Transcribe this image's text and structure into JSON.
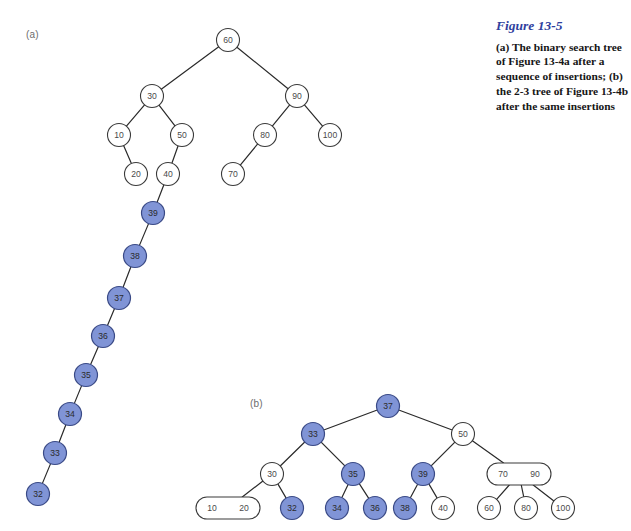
{
  "figure": {
    "panel_a_label": "(a)",
    "panel_b_label": "(b)",
    "caption_title": "Figure 13-5",
    "caption_body": "(a) The binary search tree of Figure 13-4a after a sequence of insertions; (b) the 2-3 tree of Figure 13-4b after the same insertions",
    "accent_color": "#2f3f9e",
    "highlight_color": "#8094d6",
    "stroke_color": "#2a2a2a"
  },
  "chart_data": {
    "type": "diagram",
    "title": "Figure 13-5",
    "subtitle": "(a) The binary search tree of Figure 13-4a after a sequence of insertions; (b) the 2-3 tree of Figure 13-4b after the same insertions",
    "panels": [
      {
        "id": "a",
        "label": "(a)",
        "kind": "binary-search-tree",
        "nodes": [
          {
            "id": "a60",
            "label": "60",
            "x": 228,
            "y": 40,
            "r": 11.5,
            "shape": "circle",
            "highlighted": false
          },
          {
            "id": "a30",
            "label": "30",
            "x": 152,
            "y": 96,
            "r": 11.5,
            "shape": "circle",
            "highlighted": false
          },
          {
            "id": "a90",
            "label": "90",
            "x": 297,
            "y": 96,
            "r": 11.5,
            "shape": "circle",
            "highlighted": false
          },
          {
            "id": "a10",
            "label": "10",
            "x": 119,
            "y": 135,
            "r": 11.5,
            "shape": "circle",
            "highlighted": false
          },
          {
            "id": "a50",
            "label": "50",
            "x": 182,
            "y": 135,
            "r": 11.5,
            "shape": "circle",
            "highlighted": false
          },
          {
            "id": "a80",
            "label": "80",
            "x": 265,
            "y": 135,
            "r": 11.5,
            "shape": "circle",
            "highlighted": false
          },
          {
            "id": "a100",
            "label": "100",
            "x": 330,
            "y": 135,
            "r": 11.5,
            "shape": "circle",
            "highlighted": false
          },
          {
            "id": "a20",
            "label": "20",
            "x": 136,
            "y": 174,
            "r": 11.5,
            "shape": "circle",
            "highlighted": false
          },
          {
            "id": "a40",
            "label": "40",
            "x": 168,
            "y": 174,
            "r": 11.5,
            "shape": "circle",
            "highlighted": false
          },
          {
            "id": "a70",
            "label": "70",
            "x": 233,
            "y": 174,
            "r": 11.5,
            "shape": "circle",
            "highlighted": false
          },
          {
            "id": "a39",
            "label": "39",
            "x": 153,
            "y": 213,
            "r": 11.5,
            "shape": "circle",
            "highlighted": true
          },
          {
            "id": "a38",
            "label": "38",
            "x": 135,
            "y": 256,
            "r": 11.5,
            "shape": "circle",
            "highlighted": true
          },
          {
            "id": "a37",
            "label": "37",
            "x": 119,
            "y": 298,
            "r": 11.5,
            "shape": "circle",
            "highlighted": true
          },
          {
            "id": "a36",
            "label": "36",
            "x": 103,
            "y": 336,
            "r": 11.5,
            "shape": "circle",
            "highlighted": true
          },
          {
            "id": "a35",
            "label": "35",
            "x": 86,
            "y": 375,
            "r": 11.5,
            "shape": "circle",
            "highlighted": true
          },
          {
            "id": "a34",
            "label": "34",
            "x": 70,
            "y": 414,
            "r": 11.5,
            "shape": "circle",
            "highlighted": true
          },
          {
            "id": "a33",
            "label": "33",
            "x": 55,
            "y": 453,
            "r": 11.5,
            "shape": "circle",
            "highlighted": true
          },
          {
            "id": "a32",
            "label": "32",
            "x": 38,
            "y": 494,
            "r": 11.5,
            "shape": "circle",
            "highlighted": true
          }
        ],
        "edges": [
          [
            "a60",
            "a30"
          ],
          [
            "a60",
            "a90"
          ],
          [
            "a30",
            "a10"
          ],
          [
            "a30",
            "a50"
          ],
          [
            "a90",
            "a80"
          ],
          [
            "a90",
            "a100"
          ],
          [
            "a10",
            "a20"
          ],
          [
            "a50",
            "a40"
          ],
          [
            "a80",
            "a70"
          ],
          [
            "a40",
            "a39"
          ],
          [
            "a39",
            "a38"
          ],
          [
            "a38",
            "a37"
          ],
          [
            "a37",
            "a36"
          ],
          [
            "a36",
            "a35"
          ],
          [
            "a35",
            "a34"
          ],
          [
            "a34",
            "a33"
          ],
          [
            "a33",
            "a32"
          ]
        ]
      },
      {
        "id": "b",
        "label": "(b)",
        "kind": "2-3-tree",
        "nodes": [
          {
            "id": "b37",
            "label": "37",
            "x": 388,
            "y": 406,
            "r": 11.5,
            "shape": "circle",
            "highlighted": true
          },
          {
            "id": "b33",
            "label": "33",
            "x": 313,
            "y": 434,
            "r": 11.5,
            "shape": "circle",
            "highlighted": true
          },
          {
            "id": "b50",
            "label": "50",
            "x": 463,
            "y": 434,
            "r": 11.5,
            "shape": "circle",
            "highlighted": false
          },
          {
            "id": "b30",
            "label": "30",
            "x": 272,
            "y": 474,
            "r": 11.5,
            "shape": "circle",
            "highlighted": false
          },
          {
            "id": "b35",
            "label": "35",
            "x": 353,
            "y": 474,
            "r": 11.5,
            "shape": "circle",
            "highlighted": true
          },
          {
            "id": "b39",
            "label": "39",
            "x": 423,
            "y": 474,
            "r": 11.5,
            "shape": "circle",
            "highlighted": true
          },
          {
            "id": "b7090",
            "label": "70  90",
            "x": 519,
            "y": 474,
            "w": 64,
            "h": 22,
            "shape": "oval2",
            "values": [
              "70",
              "90"
            ],
            "highlighted": false
          },
          {
            "id": "b1020",
            "label": "10  20",
            "x": 228,
            "y": 508,
            "w": 64,
            "h": 22,
            "shape": "oval2",
            "values": [
              "10",
              "20"
            ],
            "highlighted": false
          },
          {
            "id": "b32",
            "label": "32",
            "x": 292,
            "y": 508,
            "r": 11.5,
            "shape": "circle",
            "highlighted": true
          },
          {
            "id": "b34",
            "label": "34",
            "x": 337,
            "y": 508,
            "r": 11.5,
            "shape": "circle",
            "highlighted": true
          },
          {
            "id": "b36",
            "label": "36",
            "x": 375,
            "y": 508,
            "r": 11.5,
            "shape": "circle",
            "highlighted": true
          },
          {
            "id": "b38",
            "label": "38",
            "x": 405,
            "y": 508,
            "r": 11.5,
            "shape": "circle",
            "highlighted": true
          },
          {
            "id": "b40",
            "label": "40",
            "x": 443,
            "y": 508,
            "r": 11.5,
            "shape": "circle",
            "highlighted": false
          },
          {
            "id": "b60",
            "label": "60",
            "x": 489,
            "y": 508,
            "r": 11.5,
            "shape": "circle",
            "highlighted": false
          },
          {
            "id": "b80",
            "label": "80",
            "x": 526,
            "y": 508,
            "r": 11.5,
            "shape": "circle",
            "highlighted": false
          },
          {
            "id": "b100",
            "label": "100",
            "x": 563,
            "y": 508,
            "r": 11.5,
            "shape": "circle",
            "highlighted": false
          }
        ],
        "edges": [
          [
            "b37",
            "b33"
          ],
          [
            "b37",
            "b50"
          ],
          [
            "b33",
            "b30"
          ],
          [
            "b33",
            "b35"
          ],
          [
            "b50",
            "b39"
          ],
          [
            "b50",
            "b7090"
          ],
          [
            "b30",
            "b1020"
          ],
          [
            "b30",
            "b32"
          ],
          [
            "b35",
            "b34"
          ],
          [
            "b35",
            "b36"
          ],
          [
            "b39",
            "b38"
          ],
          [
            "b39",
            "b40"
          ],
          [
            "b7090",
            "b60"
          ],
          [
            "b7090",
            "b80"
          ],
          [
            "b7090",
            "b100"
          ]
        ]
      }
    ]
  }
}
